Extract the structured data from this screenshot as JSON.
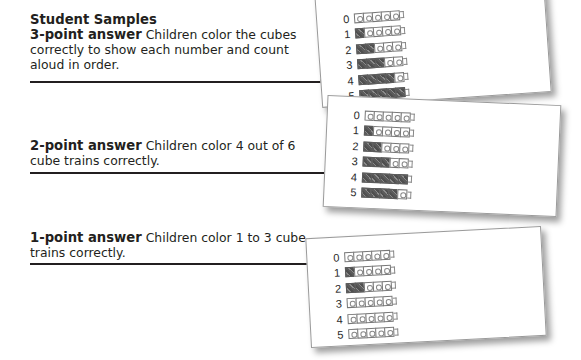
{
  "title": "Student Samples",
  "samples": [
    {
      "label": "3-point answer",
      "description": "Children color the cubes correctly to show each number and count aloud in order.",
      "rows": [
        {
          "number": "0",
          "filled": 0
        },
        {
          "number": "1",
          "filled": 1
        },
        {
          "number": "2",
          "filled": 2
        },
        {
          "number": "3",
          "filled": 3
        },
        {
          "number": "4",
          "filled": 4
        },
        {
          "number": "5",
          "filled": 5
        }
      ]
    },
    {
      "label": "2-point answer",
      "description": "Children color 4 out of 6 cube trains correctly.",
      "rows": [
        {
          "number": "0",
          "filled": 0
        },
        {
          "number": "1",
          "filled": 1
        },
        {
          "number": "2",
          "filled": 2
        },
        {
          "number": "3",
          "filled": 3
        },
        {
          "number": "4",
          "filled": 5
        },
        {
          "number": "5",
          "filled": 4
        }
      ]
    },
    {
      "label": "1-point answer",
      "description": "Children color 1 to 3 cube trains correctly.",
      "rows": [
        {
          "number": "0",
          "filled": 0
        },
        {
          "number": "1",
          "filled": 1
        },
        {
          "number": "2",
          "filled": 2
        },
        {
          "number": "3",
          "filled": 0
        },
        {
          "number": "4",
          "filled": 0
        },
        {
          "number": "5",
          "filled": 0
        }
      ]
    }
  ],
  "cubes_per_train": 5,
  "colors": {
    "ink": "#231f20",
    "scribble": "#6e6e6e",
    "card_border": "#9a9a9a"
  }
}
